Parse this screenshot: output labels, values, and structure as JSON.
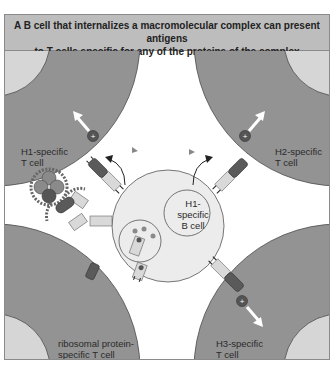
{
  "title": {
    "line1": "A B cell that internalizes a macromolecular complex can present antigens",
    "line2": "to T cells specific for any of the proteins of the complex"
  },
  "cells": {
    "b_cell": {
      "line1": "H1-",
      "line2": "specific",
      "line3": "B cell"
    },
    "t_h1": {
      "line1": "H1-specific",
      "line2": "T cell"
    },
    "t_h2": {
      "line1": "H2-specific",
      "line2": "T cell"
    },
    "t_h3": {
      "line1": "H3-specific",
      "line2": "T cell"
    },
    "t_ribo": {
      "line1": "ribosomal protein-",
      "line2": "specific T cell"
    }
  },
  "signals": {
    "plus_symbol": "+"
  },
  "colors": {
    "t_cell_fill": "#939393",
    "t_cell_nucleus": "#d6d6d6",
    "b_cell_fill": "#ececec",
    "title_bg": "#bdbdbd",
    "tcr_dark": "#5a5a5a",
    "mhc_light": "#d9d9d9",
    "signal_dark": "#555555"
  }
}
